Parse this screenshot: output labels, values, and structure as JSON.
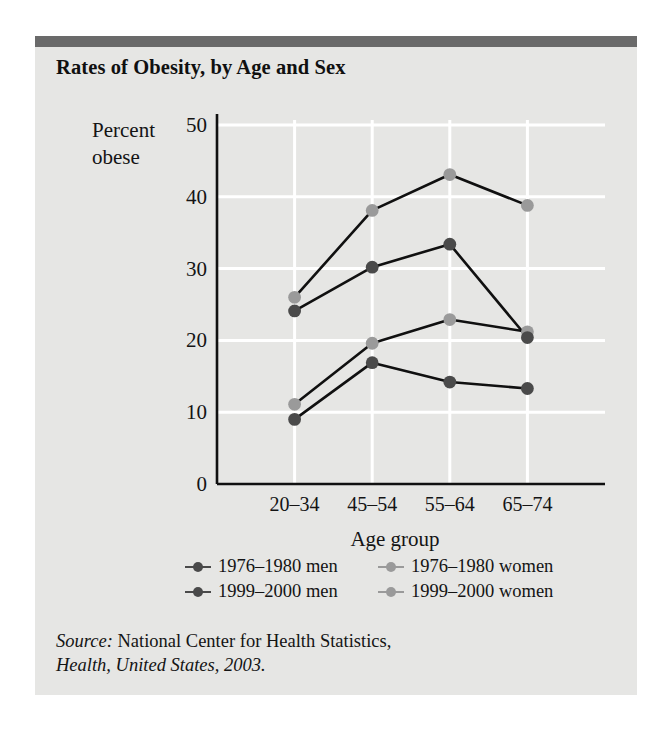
{
  "figure": {
    "title": "Rates of Obesity, by Age and Sex",
    "source_prefix": "Source:",
    "source_agency": "National Center for Health Statistics,",
    "source_publication": "Health, United States, 2003."
  },
  "legend": {
    "position": "below-axis",
    "entries": [
      {
        "label": "1976–1980 men",
        "color": "#4a4a4a"
      },
      {
        "label": "1976–1980 women",
        "color": "#9a9a9a"
      },
      {
        "label": "1999–2000 men",
        "color": "#4a4a4a"
      },
      {
        "label": "1999–2000 women",
        "color": "#9a9a9a"
      }
    ]
  },
  "colors": {
    "panel_background": "#e6e6e4",
    "top_rule": "#6a6a6a",
    "gridline": "#ffffff",
    "axis": "#101010",
    "line": "#101010",
    "marker_men": "#4a4a4a",
    "marker_women": "#9a9a9a",
    "text": "#141414"
  },
  "chart_data": {
    "type": "line",
    "title": "Rates of Obesity, by Age and Sex",
    "xlabel": "Age group",
    "ylabel": "Percent obese",
    "categories": [
      "20–34",
      "45–54",
      "55–64",
      "65–74"
    ],
    "ylim": [
      0,
      50
    ],
    "yticks": [
      0,
      10,
      20,
      30,
      40,
      50
    ],
    "ytick_labels": [
      "0",
      "10",
      "20",
      "30",
      "40",
      "50"
    ],
    "grid": true,
    "grid_axes": "both",
    "series": [
      {
        "name": "1976–1980 men",
        "color": "#4a4a4a",
        "values": [
          9.0,
          16.9,
          14.2,
          13.3
        ]
      },
      {
        "name": "1976–1980 women",
        "color": "#9a9a9a",
        "values": [
          11.1,
          19.6,
          22.9,
          21.2
        ]
      },
      {
        "name": "1999–2000 men",
        "color": "#4a4a4a",
        "values": [
          24.1,
          30.2,
          33.4,
          20.4
        ]
      },
      {
        "name": "1999–2000 women",
        "color": "#9a9a9a",
        "values": [
          26.0,
          38.1,
          43.1,
          38.8
        ]
      }
    ]
  }
}
